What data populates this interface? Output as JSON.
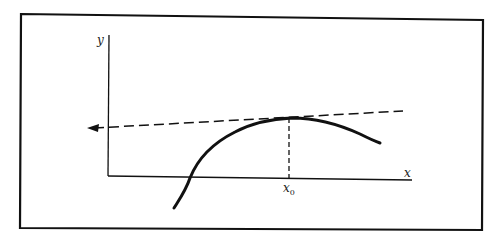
{
  "diagram": {
    "type": "tangent-line-at-maximum",
    "labels": {
      "y_axis": "y",
      "x_axis": "x",
      "x0_main": "x",
      "x0_sub": "0"
    },
    "elements": [
      "frame",
      "y-axis",
      "x-axis",
      "curve",
      "tangent-line-dashed-with-left-arrow",
      "vertical-dashed-line-at-x0"
    ],
    "colors": {
      "stroke": "#111111",
      "background": "#ffffff"
    }
  }
}
